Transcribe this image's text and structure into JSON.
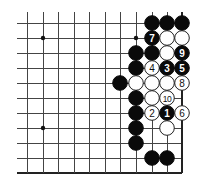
{
  "diagram": {
    "type": "go-board-fragment",
    "corner": "bottom-right",
    "columns": 11,
    "rows": 11,
    "colors": {
      "black": "#0a0a0a",
      "white": "#ffffff",
      "line": "#444444",
      "background": "#ffffff"
    },
    "star_points": [
      {
        "col": 1,
        "row": 1
      },
      {
        "col": 1,
        "row": 7
      },
      {
        "col": 7,
        "row": 1
      },
      {
        "col": 7,
        "row": 7
      }
    ],
    "stones": [
      {
        "col": 8,
        "row": 0,
        "color": "black",
        "label": ""
      },
      {
        "col": 9,
        "row": 0,
        "color": "black",
        "label": ""
      },
      {
        "col": 10,
        "row": 0,
        "color": "black",
        "label": ""
      },
      {
        "col": 8,
        "row": 1,
        "color": "black",
        "label": "7"
      },
      {
        "col": 9,
        "row": 1,
        "color": "white",
        "label": ""
      },
      {
        "col": 10,
        "row": 1,
        "color": "white",
        "label": ""
      },
      {
        "col": 7,
        "row": 2,
        "color": "black",
        "label": ""
      },
      {
        "col": 8,
        "row": 2,
        "color": "black",
        "label": ""
      },
      {
        "col": 9,
        "row": 2,
        "color": "white",
        "label": ""
      },
      {
        "col": 10,
        "row": 2,
        "color": "black",
        "label": "9"
      },
      {
        "col": 7,
        "row": 3,
        "color": "black",
        "label": ""
      },
      {
        "col": 8,
        "row": 3,
        "color": "white",
        "label": "4"
      },
      {
        "col": 9,
        "row": 3,
        "color": "black",
        "label": "3"
      },
      {
        "col": 10,
        "row": 3,
        "color": "black",
        "label": "5"
      },
      {
        "col": 6,
        "row": 4,
        "color": "black",
        "label": ""
      },
      {
        "col": 7,
        "row": 4,
        "color": "white",
        "label": ""
      },
      {
        "col": 8,
        "row": 4,
        "color": "white",
        "label": ""
      },
      {
        "col": 9,
        "row": 4,
        "color": "white",
        "label": ""
      },
      {
        "col": 10,
        "row": 4,
        "color": "white",
        "label": "8"
      },
      {
        "col": 7,
        "row": 5,
        "color": "black",
        "label": ""
      },
      {
        "col": 8,
        "row": 5,
        "color": "white",
        "label": ""
      },
      {
        "col": 9,
        "row": 5,
        "color": "white",
        "label": "10"
      },
      {
        "col": 7,
        "row": 6,
        "color": "black",
        "label": ""
      },
      {
        "col": 8,
        "row": 6,
        "color": "white",
        "label": "2"
      },
      {
        "col": 9,
        "row": 6,
        "color": "black",
        "label": "1"
      },
      {
        "col": 10,
        "row": 6,
        "color": "white",
        "label": "6"
      },
      {
        "col": 7,
        "row": 7,
        "color": "black",
        "label": ""
      },
      {
        "col": 9,
        "row": 7,
        "color": "white",
        "label": ""
      },
      {
        "col": 7,
        "row": 8,
        "color": "black",
        "label": ""
      },
      {
        "col": 8,
        "row": 9,
        "color": "black",
        "label": ""
      },
      {
        "col": 9,
        "row": 9,
        "color": "black",
        "label": ""
      }
    ]
  }
}
